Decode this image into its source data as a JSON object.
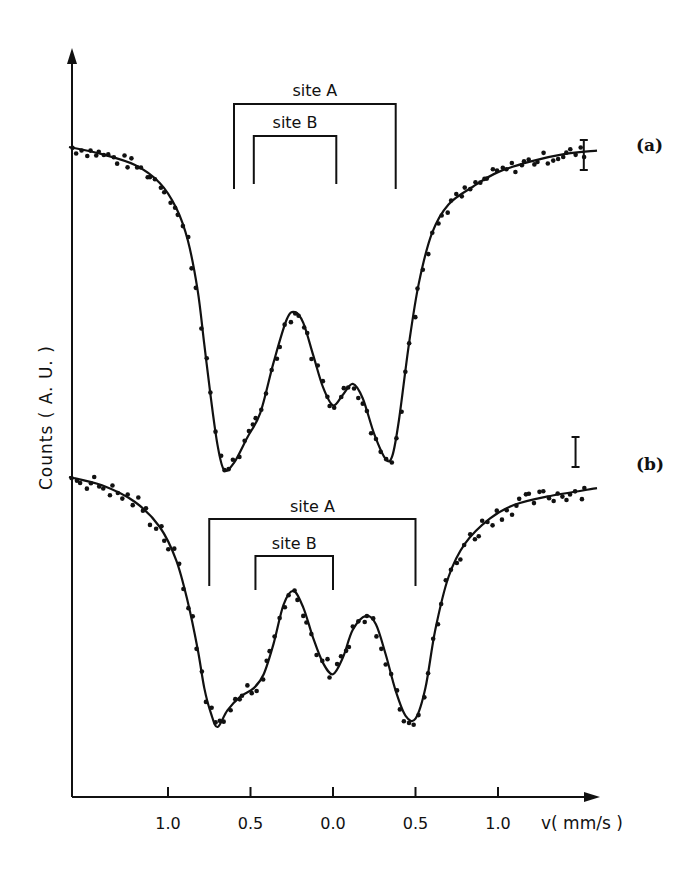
{
  "chart_data": {
    "type": "scatter",
    "title": "",
    "xlabel": "v( mm/s )",
    "ylabel": "Counts ( A. U. )",
    "x_ticks": [
      -1.0,
      -0.5,
      0.0,
      0.5,
      1.0
    ],
    "x_tick_labels": [
      "1.0",
      "0.5",
      "0.0",
      "0.5",
      "1.0"
    ],
    "xlim": [
      -1.6,
      1.6
    ],
    "grid": false,
    "legend": "none",
    "panels": [
      {
        "label": "(a)",
        "description": "Mössbauer spectrum with fitted curve (line) and experimental points (dots)",
        "baseline_relative": 1.0,
        "fit_curve": {
          "x": [
            -1.6,
            -1.4,
            -1.2,
            -1.05,
            -0.95,
            -0.88,
            -0.82,
            -0.78,
            -0.74,
            -0.7,
            -0.66,
            -0.6,
            -0.52,
            -0.44,
            -0.36,
            -0.28,
            -0.23,
            -0.18,
            -0.12,
            -0.06,
            0.0,
            0.06,
            0.12,
            0.18,
            0.25,
            0.32,
            0.36,
            0.4,
            0.46,
            0.52,
            0.6,
            0.7,
            0.85,
            1.0,
            1.2,
            1.4,
            1.6
          ],
          "y": [
            1.0,
            0.98,
            0.95,
            0.9,
            0.83,
            0.74,
            0.6,
            0.45,
            0.3,
            0.17,
            0.1,
            0.12,
            0.19,
            0.26,
            0.4,
            0.52,
            0.54,
            0.51,
            0.42,
            0.33,
            0.28,
            0.31,
            0.34,
            0.3,
            0.2,
            0.13,
            0.14,
            0.24,
            0.45,
            0.62,
            0.76,
            0.84,
            0.89,
            0.93,
            0.96,
            0.98,
            0.99
          ]
        },
        "annotations": [
          {
            "text": "site A",
            "left_x": -0.6,
            "right_x": 0.38
          },
          {
            "text": "site B",
            "left_x": -0.48,
            "right_x": 0.02
          }
        ],
        "error_bar": {
          "x": 1.52,
          "description": "vertical error bar at right end"
        }
      },
      {
        "label": "(b)",
        "description": "Mössbauer spectrum with fitted curve (line) and experimental points (dots)",
        "baseline_relative": 1.0,
        "fit_curve": {
          "x": [
            -1.6,
            -1.4,
            -1.2,
            -1.05,
            -0.95,
            -0.88,
            -0.82,
            -0.78,
            -0.74,
            -0.7,
            -0.64,
            -0.56,
            -0.48,
            -0.42,
            -0.36,
            -0.3,
            -0.24,
            -0.18,
            -0.12,
            -0.06,
            0.0,
            0.06,
            0.12,
            0.2,
            0.26,
            0.32,
            0.38,
            0.44,
            0.5,
            0.56,
            0.62,
            0.7,
            0.8,
            0.95,
            1.1,
            1.3,
            1.6
          ],
          "y": [
            1.0,
            0.97,
            0.91,
            0.82,
            0.7,
            0.55,
            0.38,
            0.24,
            0.15,
            0.1,
            0.16,
            0.21,
            0.24,
            0.29,
            0.4,
            0.54,
            0.59,
            0.53,
            0.42,
            0.33,
            0.29,
            0.35,
            0.45,
            0.5,
            0.47,
            0.36,
            0.23,
            0.14,
            0.13,
            0.24,
            0.45,
            0.64,
            0.76,
            0.85,
            0.9,
            0.93,
            0.96
          ]
        },
        "annotations": [
          {
            "text": "site A",
            "left_x": -0.75,
            "right_x": 0.5
          },
          {
            "text": "site B",
            "left_x": -0.47,
            "right_x": 0.0
          }
        ],
        "error_bar": {
          "x": 1.47,
          "description": "vertical error bar at right end"
        }
      }
    ]
  },
  "labels": {
    "y_axis": "Counts ( A. U. )",
    "x_axis_unit": "v( mm/s )",
    "panel_a": "(a)",
    "panel_b": "(b)",
    "site_a": "site A",
    "site_b": "site B"
  }
}
